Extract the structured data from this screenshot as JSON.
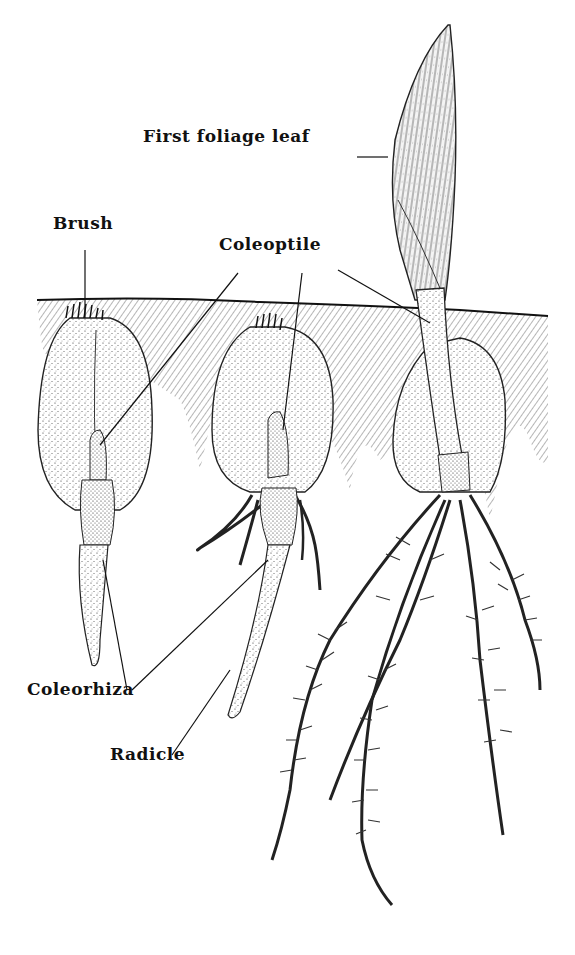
{
  "figure": {
    "background": "#ffffff",
    "ink": "#111111",
    "labels": [
      {
        "id": "first-foliage-leaf",
        "text": "First foliage leaf",
        "x": 143,
        "y": 142
      },
      {
        "id": "brush",
        "text": "Brush",
        "x": 53,
        "y": 229
      },
      {
        "id": "coleoptile",
        "text": "Coleoptile",
        "x": 219,
        "y": 250
      },
      {
        "id": "coleorhiza",
        "text": "Coleorhiza",
        "x": 27,
        "y": 695
      },
      {
        "id": "radicle",
        "text": "Radicle",
        "x": 110,
        "y": 760
      }
    ],
    "leader_lines": [
      {
        "label": "first-foliage-leaf",
        "x1": 357,
        "y1": 157,
        "x2": 388,
        "y2": 157
      },
      {
        "label": "brush",
        "x1": 85,
        "y1": 250,
        "x2": 85,
        "y2": 318
      },
      {
        "label": "coleoptile",
        "x1": 238,
        "y1": 273,
        "x2": 100,
        "y2": 445
      },
      {
        "label": "coleoptile",
        "x1": 302,
        "y1": 273,
        "x2": 283,
        "y2": 430
      },
      {
        "label": "coleoptile",
        "x1": 338,
        "y1": 270,
        "x2": 430,
        "y2": 323
      },
      {
        "label": "coleorhiza",
        "x1": 127,
        "y1": 690,
        "x2": 103,
        "y2": 560
      },
      {
        "label": "coleorhiza",
        "x1": 132,
        "y1": 690,
        "x2": 268,
        "y2": 560
      },
      {
        "label": "radicle",
        "x1": 172,
        "y1": 755,
        "x2": 230,
        "y2": 670
      }
    ]
  }
}
